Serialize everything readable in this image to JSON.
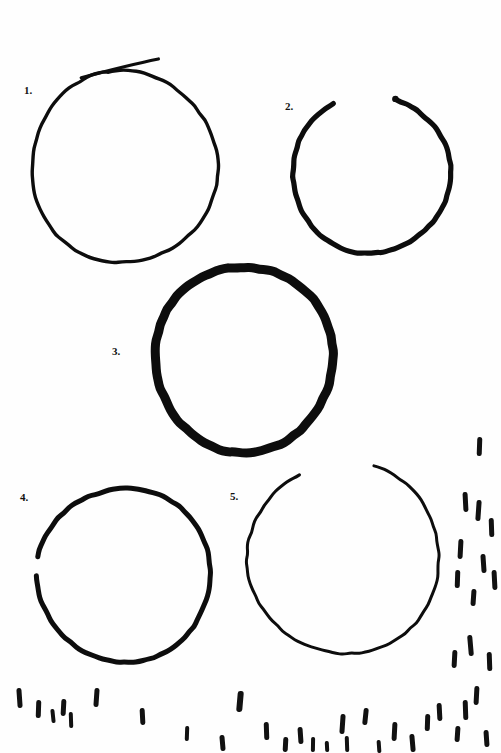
{
  "page": {
    "width": 501,
    "height": 753,
    "background_color": "#fefefe",
    "ink_color": "#0d0d0d"
  },
  "figures": [
    {
      "id": "figure-1",
      "label": "1.",
      "label_x": 24,
      "label_y": 85,
      "cx": 124,
      "cy": 167,
      "rx": 93,
      "ry": 96,
      "stroke_width": 3.4,
      "gap": "none",
      "note": "closed loop with overshooting tail crossing at top"
    },
    {
      "id": "figure-2",
      "label": "2.",
      "label_x": 285,
      "label_y": 101,
      "cx": 371,
      "cy": 174,
      "rx": 79,
      "ry": 79,
      "stroke_width": 5.2,
      "gap": "top",
      "note": "open at top, blunt stroke terminal on the left side of the gap"
    },
    {
      "id": "figure-3",
      "label": "3.",
      "label_x": 112,
      "label_y": 346,
      "cx": 244,
      "cy": 359,
      "rx": 89,
      "ry": 93,
      "stroke_width": 9.0,
      "gap": "none",
      "note": "heaviest stroke weight of the five"
    },
    {
      "id": "figure-4",
      "label": "4.",
      "label_x": 20,
      "label_y": 492,
      "cx": 124,
      "cy": 575,
      "rx": 87,
      "ry": 87,
      "stroke_width": 5.0,
      "gap": "upper-left",
      "note": "slight thinning / break at the upper left"
    },
    {
      "id": "figure-5",
      "label": "5.",
      "label_x": 230,
      "label_y": 491,
      "cx": 344,
      "cy": 558,
      "rx": 96,
      "ry": 96,
      "stroke_width": 3.0,
      "gap": "top",
      "note": "thin stroke, small opening at the top"
    }
  ],
  "tick_marks": {
    "name": "scattered-vertical-dashes",
    "color": "#111111",
    "bottom_field": [
      {
        "x": 17,
        "y": 688,
        "w": 5,
        "h": 20,
        "rot": -4
      },
      {
        "x": 36,
        "y": 700,
        "w": 5,
        "h": 18,
        "rot": 2
      },
      {
        "x": 51,
        "y": 709,
        "w": 4,
        "h": 14,
        "rot": -6
      },
      {
        "x": 61,
        "y": 699,
        "w": 5,
        "h": 17,
        "rot": 3
      },
      {
        "x": 69,
        "y": 712,
        "w": 4,
        "h": 16,
        "rot": -2
      },
      {
        "x": 94,
        "y": 688,
        "w": 5,
        "h": 19,
        "rot": 4
      },
      {
        "x": 140,
        "y": 708,
        "w": 5,
        "h": 17,
        "rot": -3
      },
      {
        "x": 185,
        "y": 726,
        "w": 4,
        "h": 15,
        "rot": 2
      },
      {
        "x": 220,
        "y": 735,
        "w": 5,
        "h": 16,
        "rot": -5
      },
      {
        "x": 237,
        "y": 691,
        "w": 6,
        "h": 21,
        "rot": 5
      },
      {
        "x": 264,
        "y": 722,
        "w": 5,
        "h": 18,
        "rot": -2
      },
      {
        "x": 283,
        "y": 737,
        "w": 5,
        "h": 15,
        "rot": 3
      },
      {
        "x": 298,
        "y": 727,
        "w": 5,
        "h": 17,
        "rot": -4
      },
      {
        "x": 311,
        "y": 737,
        "w": 4,
        "h": 15,
        "rot": 1
      },
      {
        "x": 325,
        "y": 741,
        "w": 4,
        "h": 11,
        "rot": -3
      },
      {
        "x": 340,
        "y": 714,
        "w": 5,
        "h": 20,
        "rot": 4
      },
      {
        "x": 345,
        "y": 736,
        "w": 4,
        "h": 16,
        "rot": -2
      },
      {
        "x": 363,
        "y": 708,
        "w": 5,
        "h": 17,
        "rot": 6
      },
      {
        "x": 377,
        "y": 740,
        "w": 4,
        "h": 13,
        "rot": -4
      },
      {
        "x": 392,
        "y": 722,
        "w": 5,
        "h": 19,
        "rot": 3
      },
      {
        "x": 410,
        "y": 734,
        "w": 5,
        "h": 18,
        "rot": -5
      },
      {
        "x": 425,
        "y": 714,
        "w": 5,
        "h": 17,
        "rot": 2
      },
      {
        "x": 437,
        "y": 703,
        "w": 5,
        "h": 18,
        "rot": -3
      },
      {
        "x": 455,
        "y": 726,
        "w": 5,
        "h": 16,
        "rot": 4
      },
      {
        "x": 463,
        "y": 700,
        "w": 5,
        "h": 20,
        "rot": -2
      },
      {
        "x": 474,
        "y": 686,
        "w": 5,
        "h": 19,
        "rot": 3
      },
      {
        "x": 484,
        "y": 730,
        "w": 5,
        "h": 17,
        "rot": -4
      }
    ],
    "right_field": [
      {
        "x": 477,
        "y": 437,
        "w": 5,
        "h": 19,
        "rot": 2
      },
      {
        "x": 463,
        "y": 492,
        "w": 5,
        "h": 20,
        "rot": -3
      },
      {
        "x": 476,
        "y": 500,
        "w": 5,
        "h": 21,
        "rot": 4
      },
      {
        "x": 489,
        "y": 518,
        "w": 5,
        "h": 19,
        "rot": -2
      },
      {
        "x": 458,
        "y": 539,
        "w": 5,
        "h": 20,
        "rot": 3
      },
      {
        "x": 481,
        "y": 554,
        "w": 5,
        "h": 19,
        "rot": -4
      },
      {
        "x": 455,
        "y": 570,
        "w": 5,
        "h": 18,
        "rot": 2
      },
      {
        "x": 492,
        "y": 570,
        "w": 5,
        "h": 20,
        "rot": -3
      },
      {
        "x": 471,
        "y": 589,
        "w": 5,
        "h": 17,
        "rot": 4
      },
      {
        "x": 468,
        "y": 635,
        "w": 5,
        "h": 21,
        "rot": -5
      },
      {
        "x": 452,
        "y": 650,
        "w": 5,
        "h": 18,
        "rot": 3
      },
      {
        "x": 487,
        "y": 652,
        "w": 5,
        "h": 19,
        "rot": -2
      }
    ]
  }
}
